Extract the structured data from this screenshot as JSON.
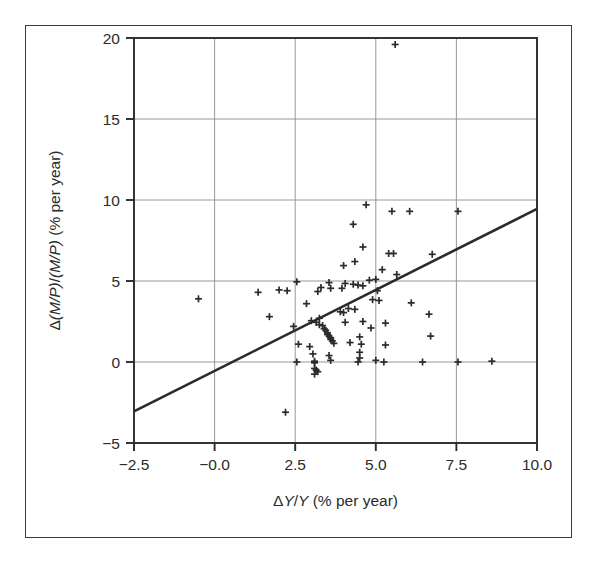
{
  "chart_data": {
    "type": "scatter",
    "title": "",
    "subtitle": "",
    "xlabel": "ΔY/Y (% per year)",
    "ylabel": "Δ(M/P)/(M/P) (% per year)",
    "xlabel_parts": {
      "delta": "Δ",
      "var1": "Y",
      "slash": "/",
      "var2": "Y",
      "units": " (% per year)"
    },
    "ylabel_parts": {
      "delta": "Δ",
      "num": "(M/P)",
      "slash": "/",
      "den": "(M/P)",
      "units": " (% per year)"
    },
    "xlim": [
      -2.5,
      10.0
    ],
    "ylim": [
      -5,
      20
    ],
    "xticks": [
      -2.5,
      -0.0,
      2.5,
      5.0,
      7.5,
      10.0
    ],
    "xtick_labels": [
      "−2.5",
      "−0.0",
      "2.5",
      "5.0",
      "7.5",
      "10.0"
    ],
    "yticks": [
      -5,
      0,
      5,
      10,
      15,
      20
    ],
    "ytick_labels": [
      "−5",
      "0",
      "5",
      "10",
      "15",
      "20"
    ],
    "grid": true,
    "grid_color": "#8c8c8c",
    "frame_color": "#2b2b2b",
    "marker": "plus",
    "marker_color": "#2b2b2b",
    "marker_size": 7,
    "legend": null,
    "legend_position": "none",
    "trendline": {
      "label": "",
      "color": "#2b2b2b",
      "width": 2.6,
      "x_start": -2.5,
      "y_start": -3.05,
      "x_end": 10.0,
      "y_end": 9.45,
      "slope": 1.0,
      "intercept": -0.55
    },
    "points": [
      [
        5.6,
        19.6
      ],
      [
        4.7,
        9.7
      ],
      [
        5.5,
        9.3
      ],
      [
        6.05,
        9.3
      ],
      [
        7.55,
        9.3
      ],
      [
        4.3,
        8.5
      ],
      [
        4.6,
        7.1
      ],
      [
        5.4,
        6.7
      ],
      [
        5.55,
        6.7
      ],
      [
        6.75,
        6.65
      ],
      [
        4.35,
        6.2
      ],
      [
        4.0,
        5.95
      ],
      [
        5.2,
        5.7
      ],
      [
        5.65,
        5.4
      ],
      [
        2.55,
        4.95
      ],
      [
        3.55,
        4.9
      ],
      [
        4.05,
        4.85
      ],
      [
        4.3,
        4.8
      ],
      [
        4.45,
        4.75
      ],
      [
        4.6,
        4.7
      ],
      [
        3.3,
        4.6
      ],
      [
        3.6,
        4.55
      ],
      [
        2.0,
        4.45
      ],
      [
        2.25,
        4.4
      ],
      [
        3.2,
        4.35
      ],
      [
        1.35,
        4.3
      ],
      [
        -0.5,
        3.9
      ],
      [
        4.9,
        3.85
      ],
      [
        5.1,
        3.8
      ],
      [
        6.1,
        3.65
      ],
      [
        2.85,
        3.6
      ],
      [
        4.15,
        3.3
      ],
      [
        4.35,
        3.25
      ],
      [
        3.9,
        3.1
      ],
      [
        4.0,
        3.05
      ],
      [
        6.65,
        2.95
      ],
      [
        1.7,
        2.8
      ],
      [
        3.25,
        2.7
      ],
      [
        3.0,
        2.55
      ],
      [
        4.6,
        2.5
      ],
      [
        3.15,
        2.45
      ],
      [
        4.05,
        2.45
      ],
      [
        5.3,
        2.4
      ],
      [
        3.25,
        2.3
      ],
      [
        3.35,
        2.25
      ],
      [
        2.45,
        2.2
      ],
      [
        4.85,
        2.1
      ],
      [
        3.4,
        2.05
      ],
      [
        3.45,
        1.95
      ],
      [
        3.5,
        1.8
      ],
      [
        3.5,
        1.7
      ],
      [
        3.55,
        1.6
      ],
      [
        4.5,
        1.55
      ],
      [
        3.6,
        1.5
      ],
      [
        3.6,
        1.4
      ],
      [
        3.65,
        1.3
      ],
      [
        4.2,
        1.2
      ],
      [
        3.7,
        1.15
      ],
      [
        4.55,
        1.1
      ],
      [
        5.3,
        1.05
      ],
      [
        6.7,
        1.6
      ],
      [
        2.95,
        0.95
      ],
      [
        4.5,
        0.6
      ],
      [
        3.05,
        0.5
      ],
      [
        3.55,
        0.4
      ],
      [
        4.5,
        0.25
      ],
      [
        5.0,
        0.1
      ],
      [
        3.1,
        0.05
      ],
      [
        2.55,
        0.0
      ],
      [
        3.1,
        -0.05
      ],
      [
        3.6,
        0.1
      ],
      [
        4.45,
        0.0
      ],
      [
        5.25,
        0.0
      ],
      [
        6.45,
        0.0
      ],
      [
        7.55,
        0.0
      ],
      [
        3.1,
        -0.4
      ],
      [
        3.15,
        -0.5
      ],
      [
        3.2,
        -0.6
      ],
      [
        3.1,
        -0.75
      ],
      [
        2.2,
        -3.1
      ],
      [
        8.6,
        0.05
      ],
      [
        5.0,
        5.1
      ],
      [
        4.8,
        5.05
      ],
      [
        3.95,
        4.55
      ],
      [
        5.05,
        4.4
      ],
      [
        2.6,
        1.1
      ]
    ]
  },
  "figure": {
    "background_color": "#ffffff",
    "border_color": "#3a3a3a"
  }
}
